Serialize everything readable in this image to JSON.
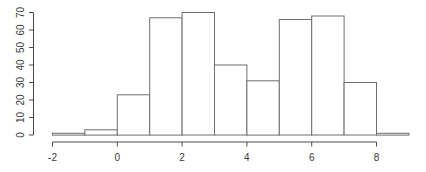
{
  "chart_data": {
    "type": "bar",
    "subtype": "histogram",
    "title": "",
    "xlabel": "",
    "ylabel": "",
    "breaks": [
      -2,
      -1,
      0,
      1,
      2,
      3,
      4,
      5,
      6,
      7,
      8,
      9
    ],
    "values": [
      1,
      3,
      23,
      67,
      70,
      40,
      31,
      66,
      68,
      30,
      1
    ],
    "xlim": [
      -2,
      9
    ],
    "ylim": [
      0,
      70
    ],
    "x_ticks": [
      -2,
      0,
      2,
      4,
      6,
      8
    ],
    "y_ticks": [
      0,
      10,
      20,
      30,
      40,
      50,
      60,
      70
    ],
    "y_tick_label_rotation": 90,
    "grid": false,
    "legend": null,
    "style": {
      "background": "#ffffff",
      "bar_fill": "#ffffff",
      "bar_stroke": "#6e6e6e",
      "axis_color": "#4a4a4a",
      "tick_label_color": "#3a3a3a"
    }
  }
}
